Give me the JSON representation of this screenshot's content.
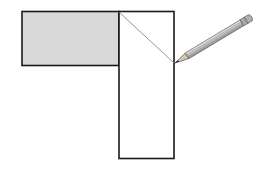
{
  "diagram": {
    "shapes": {
      "shaded_rectangle": {
        "x": 22,
        "y": 11,
        "width": 97,
        "height": 54,
        "fill": "#d9d9d9",
        "stroke": "#1a1a1a"
      },
      "vertical_rectangle": {
        "x": 119,
        "y": 11,
        "width": 55,
        "height": 147,
        "fill": "#ffffff",
        "stroke": "#1a1a1a"
      },
      "diagonal_line": {
        "x1": 119,
        "y1": 12,
        "x2": 174,
        "y2": 63,
        "stroke": "#8a8a8a"
      }
    },
    "pencil": {
      "tip_x": 175,
      "tip_y": 63,
      "end_x": 255,
      "end_y": 15,
      "body_color": "#bdbdbd"
    }
  }
}
